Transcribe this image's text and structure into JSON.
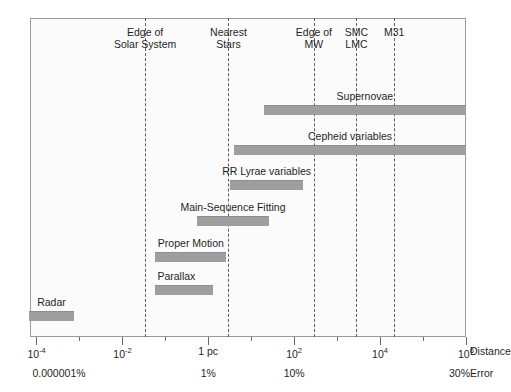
{
  "chart_data": {
    "type": "bar",
    "orientation": "horizontal",
    "title": "",
    "xlabel": "Distance",
    "ylabel": "",
    "secondary_xlabel": "Error",
    "x_scale": "log10",
    "x_unit": "pc",
    "xlim_log10": [
      -4.15,
      6.0
    ],
    "grid": false,
    "legend": "none",
    "x_ticks": [
      {
        "label_base": "10",
        "label_exp": "-4",
        "log10": -4
      },
      {
        "label_base": "10",
        "label_exp": "-2",
        "log10": -2
      },
      {
        "label_base": "1 pc",
        "label_exp": "",
        "log10": 0
      },
      {
        "label_base": "10",
        "label_exp": "2",
        "log10": 2
      },
      {
        "label_base": "10",
        "label_exp": "4",
        "log10": 4
      },
      {
        "label_base": "10",
        "label_exp": "6",
        "log10": 6
      }
    ],
    "error_ticks": [
      {
        "label": "0.000001%",
        "log10": -4
      },
      {
        "label": "1%",
        "log10": 0
      },
      {
        "label": "10%",
        "log10": 2
      },
      {
        "label": "30%",
        "log10": 6
      }
    ],
    "markers": [
      {
        "name": "Edge of\nSolar System",
        "log10": -1.47
      },
      {
        "name": "Nearest\nStars",
        "log10": 0.47
      },
      {
        "name": "Edge of\nMW",
        "log10": 2.46
      },
      {
        "name": "SMC\nLMC",
        "log10": 3.45
      },
      {
        "name": "M31",
        "log10": 4.33
      }
    ],
    "categories": [
      "Supernovae",
      "Cepheid variables",
      "RR Lyrae variables",
      "Main-Sequence Fitting",
      "Proper Motion",
      "Parallax",
      "Radar"
    ],
    "bars": [
      {
        "label": "Supernovae",
        "start_log10": 1.3,
        "end_log10": 6.0,
        "label_align": "center"
      },
      {
        "label": "Cepheid variables",
        "start_log10": 0.6,
        "end_log10": 6.0,
        "label_align": "center"
      },
      {
        "label": "RR Lyrae variables",
        "start_log10": 0.51,
        "end_log10": 2.21,
        "label_align": "center"
      },
      {
        "label": "Main-Sequence Fitting",
        "start_log10": -0.26,
        "end_log10": 1.41,
        "label_align": "center"
      },
      {
        "label": "Proper Motion",
        "start_log10": -1.23,
        "end_log10": 0.42,
        "label_align": "center"
      },
      {
        "label": "Parallax",
        "start_log10": -1.23,
        "end_log10": 0.1,
        "label_align": "left"
      },
      {
        "label": "Radar",
        "start_log10": -4.17,
        "end_log10": -3.12,
        "label_align": "center"
      }
    ]
  },
  "axis": {
    "distance_name": "Distance",
    "error_name": "Error"
  },
  "colors": {
    "bar_fill": "#9e9e9e",
    "frame": "#9a9a9a",
    "marker_line": "#5d5d5d",
    "text": "#1f1f1f",
    "plot_background": "#fbfbfb"
  }
}
